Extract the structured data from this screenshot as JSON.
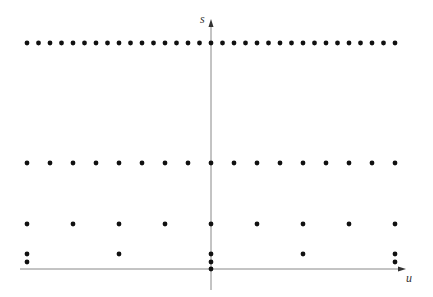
{
  "diagram": {
    "axes": {
      "vertical_label": "s",
      "horizontal_label": "u",
      "origin_px": [
        211,
        269
      ],
      "axis_color": "#888888"
    },
    "dot_color": "#111111",
    "rows": [
      {
        "name": "row-1",
        "y_px": 43,
        "count": 33,
        "x_start": 27,
        "x_end": 395
      },
      {
        "name": "row-2",
        "y_px": 163,
        "count": 17,
        "x_start": 27,
        "x_end": 395
      },
      {
        "name": "row-3",
        "y_px": 224,
        "count": 9,
        "x_start": 27,
        "x_end": 395
      },
      {
        "name": "row-4",
        "y_px": 254,
        "count": 5,
        "x_start": 27,
        "x_end": 395
      },
      {
        "name": "row-5",
        "y_px": 262,
        "count": 3,
        "x_start": 27,
        "x_end": 395
      },
      {
        "name": "row-6",
        "y_px": 269,
        "count": 1,
        "x_start": 211,
        "x_end": 211
      }
    ]
  }
}
